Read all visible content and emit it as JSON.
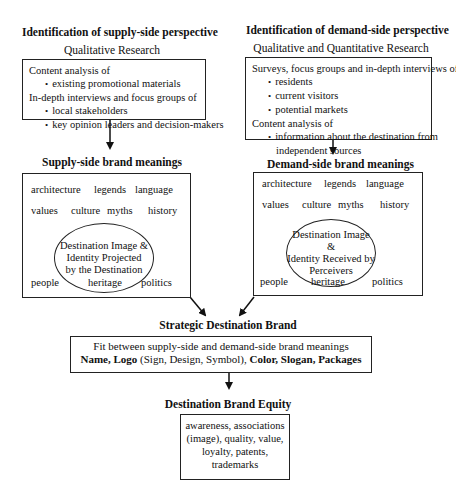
{
  "supply": {
    "heading": "Identification of supply-side perspective",
    "method": "Qualitative Research",
    "research_lines": [
      {
        "text": "Content analysis of",
        "bullet": false
      },
      {
        "text": "existing promotional materials",
        "bullet": true
      },
      {
        "text": "In-depth interviews and focus groups of",
        "bullet": false
      },
      {
        "text": "local stakeholders",
        "bullet": true
      },
      {
        "text": "key opinion leaders and decision-makers",
        "bullet": true
      }
    ],
    "meanings_title": "Supply-side brand meanings",
    "words": [
      "architecture",
      "legends",
      "language",
      "values",
      "culture",
      "myths",
      "history",
      "people",
      "heritage",
      "politics"
    ],
    "core": [
      "Destination Image &",
      "Identity Projected",
      "by the Destination"
    ]
  },
  "demand": {
    "heading": "Identification of demand-side perspective",
    "method": "Qualitative and Quantitative Research",
    "research_lines": [
      {
        "text": "Surveys, focus groups and in-depth interviews of",
        "bullet": false
      },
      {
        "text": "residents",
        "bullet": true
      },
      {
        "text": "current visitors",
        "bullet": true
      },
      {
        "text": "potential markets",
        "bullet": true
      },
      {
        "text": "Content analysis of",
        "bullet": false
      },
      {
        "text": "information about the destination from",
        "bullet": true
      },
      {
        "text": "independent sources",
        "bullet": false
      }
    ],
    "meanings_title": "Demand-side brand meanings",
    "words": [
      "architecture",
      "legends",
      "language",
      "values",
      "culture",
      "myths",
      "history",
      "people",
      "heritage",
      "politics"
    ],
    "core": [
      "Destination Image &",
      "Identity Received by",
      "Perceivers"
    ]
  },
  "strategic": {
    "title": "Strategic Destination Brand",
    "line1": "Fit between supply-side and demand-side brand meanings",
    "line2_a": "Name, Logo",
    "line2_b": " (Sign, Design, Symbol), ",
    "line2_c": "Color, Slogan, Packages"
  },
  "equity": {
    "title": "Destination Brand Equity",
    "lines": [
      "awareness, associations",
      "(image), quality, value,",
      "loyalty, patents,",
      "trademarks"
    ]
  }
}
